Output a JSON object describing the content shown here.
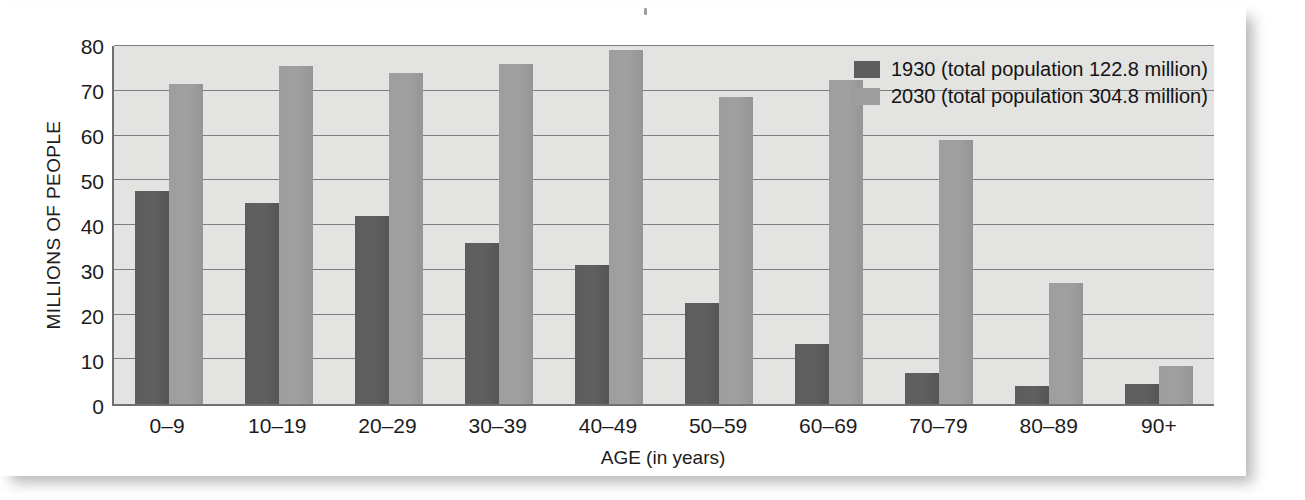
{
  "chart_data": {
    "type": "bar",
    "title": "",
    "xlabel": "AGE (in years)",
    "ylabel": "MILLIONS OF PEOPLE",
    "ylim": [
      0,
      80
    ],
    "yticks": [
      0,
      10,
      20,
      30,
      40,
      50,
      60,
      70,
      80
    ],
    "grid": true,
    "legend_position": "top-right",
    "categories": [
      "0–9",
      "10–19",
      "20–29",
      "30–39",
      "40–49",
      "50–59",
      "60–69",
      "70–79",
      "80–89",
      "90+"
    ],
    "series": [
      {
        "name": "1930 (total population 122.8 million)",
        "short_name": "1930",
        "color": "#5d5d5d",
        "values": [
          47.5,
          45.0,
          42.0,
          36.0,
          31.0,
          22.5,
          13.5,
          7.0,
          4.0,
          4.5
        ]
      },
      {
        "name": "2030 (total population 304.8 million)",
        "short_name": "2030",
        "color": "#9e9e9e",
        "values": [
          71.5,
          75.5,
          74.0,
          76.0,
          79.0,
          68.5,
          72.5,
          59.0,
          27.0,
          8.5
        ]
      }
    ]
  },
  "legend": {
    "items": [
      {
        "label": "1930 (total population 122.8 million)",
        "color": "#5d5d5d"
      },
      {
        "label": "2030 (total population 304.8 million)",
        "color": "#9e9e9e"
      }
    ]
  },
  "colors": {
    "plot_background": "#e3e3e1",
    "axis": "#6f6f6f",
    "gridline": "#7d7d7d",
    "page_background": "#ffffff",
    "series_1930": "#5d5d5d",
    "series_2030": "#9e9e9e"
  }
}
